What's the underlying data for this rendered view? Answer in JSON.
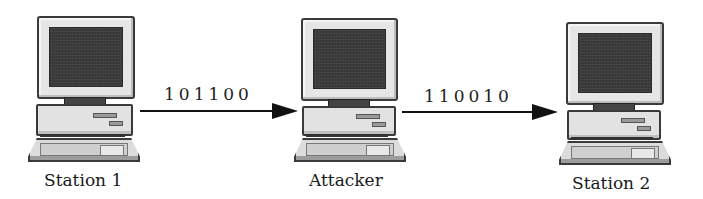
{
  "diagram": {
    "type": "man-in-the-middle",
    "nodes": [
      {
        "id": "station1",
        "label": "Station 1",
        "icon": "desktop-computer-icon"
      },
      {
        "id": "attacker",
        "label": "Attacker",
        "icon": "desktop-computer-icon"
      },
      {
        "id": "station2",
        "label": "Station 2",
        "icon": "desktop-computer-icon"
      }
    ],
    "edges": [
      {
        "from": "station1",
        "to": "attacker",
        "label": "101100"
      },
      {
        "from": "attacker",
        "to": "station2",
        "label": "110010"
      }
    ]
  },
  "colors": {
    "ink": "#111111",
    "screen": "#3b3b3b",
    "casing": "#e6e6e6"
  }
}
